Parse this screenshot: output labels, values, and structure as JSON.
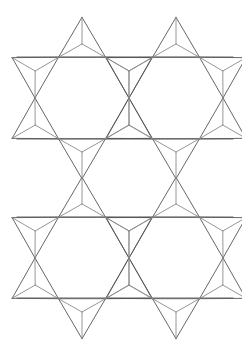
{
  "figure": {
    "type": "geometric-line-diagram",
    "width": 242,
    "height": 352,
    "background_color": "#ffffff",
    "stroke_color": "#565656",
    "stroke_color_light": "#8a8a8a",
    "stroke_width": 0.9
  },
  "geometry": {
    "hexagon_circumradius": 47,
    "point_height": 40,
    "column_spacing": 94,
    "row_spacing": 160,
    "star_centers": [
      {
        "name": "star-top-left",
        "cx": 82,
        "cy": 98
      },
      {
        "name": "star-top-right",
        "cx": 176,
        "cy": 98
      },
      {
        "name": "star-bottom-left",
        "cx": 82,
        "cy": 258
      },
      {
        "name": "star-bottom-right",
        "cx": 176,
        "cy": 258
      }
    ],
    "horizontal_rails": [
      {
        "name": "rail-1",
        "y": 57,
        "x1": 17,
        "x2": 233
      },
      {
        "name": "rail-2",
        "y": 139,
        "x1": 17,
        "x2": 233
      },
      {
        "name": "rail-3",
        "y": 217,
        "x1": 17,
        "x2": 233
      },
      {
        "name": "rail-4",
        "y": 298,
        "x1": 17,
        "x2": 233
      }
    ],
    "rail_vertices_x": [
      17,
      58,
      105,
      152,
      199,
      233
    ],
    "notes": "Hexagon vertices lie at angles 0, 60, 120, 180, 240 and 300 degrees. Triangular points sit on each hexagon edge, apex projected outward along the edge normal."
  },
  "chart_data": {
    "type": "line",
    "xlabel": "",
    "ylabel": "",
    "grid": false,
    "legend": "none",
    "xlim": [
      0,
      242
    ],
    "ylim": [
      0,
      352
    ],
    "series": [
      {
        "name": "hexagon-outlines",
        "stroke": "#565656",
        "description": "Six-sided empty hexagon at the core of each star"
      },
      {
        "name": "star-point-outlines",
        "stroke": "#565656",
        "description": "Outward pointing triangles, six per star"
      },
      {
        "name": "star-point-subdivisions",
        "stroke": "#8a8a8a",
        "description": "Three segments inside each triangle meeting at its centroid"
      }
    ]
  },
  "labels": {
    "caption": ""
  }
}
